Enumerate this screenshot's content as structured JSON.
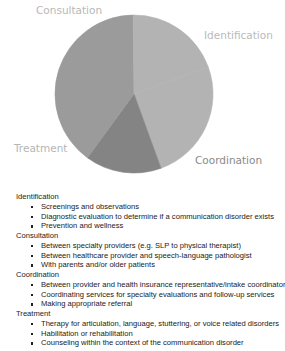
{
  "chart_data": {
    "type": "pie",
    "title": "",
    "categories": [
      "Identification",
      "Coordination",
      "Treatment",
      "Consultation"
    ],
    "values": [
      25,
      15.6,
      39.8,
      19.6
    ],
    "colors": [
      "#b3b3b3",
      "#848484",
      "#9b9b9b",
      "#b3b3b3"
    ],
    "start_angle_deg": -20,
    "labels": [
      {
        "text": "Consultation",
        "x": 36,
        "y": 4,
        "color": "#b8b8b8"
      },
      {
        "text": "Identification",
        "x": 204,
        "y": 29,
        "color": "#bababa"
      },
      {
        "text": "Treatment",
        "x": 14,
        "y": 142,
        "color": "#b5b5b5"
      },
      {
        "text": "Coordination",
        "x": 195,
        "y": 154,
        "color": "#8a8a8a"
      }
    ],
    "legend": "none",
    "grid": false
  },
  "list": {
    "groups": [
      {
        "title": "Identification",
        "items": [
          "Screenings and observations",
          "Diagnostic evaluation to determine if a communication disorder exists",
          "Prevention and wellness"
        ]
      },
      {
        "title": "Consultation",
        "items": [
          "Between specialty providers (e.g. SLP to physical therapist)",
          "Between healthcare provider and speech-language pathologist",
          "With parents and/or older patients"
        ]
      },
      {
        "title": "Coordination",
        "items": [
          "Between provider and health insurance representative/intake coordinator",
          "Coordinating services for specialty evaluations and follow-up services",
          "Making appropriate referral"
        ]
      },
      {
        "title": "Treatment",
        "items": [
          "Therapy for articulation, language, stuttering, or voice related disorders",
          "Habilitation or rehabilitation",
          "Counseling within the context of the communication disorder"
        ]
      }
    ]
  }
}
